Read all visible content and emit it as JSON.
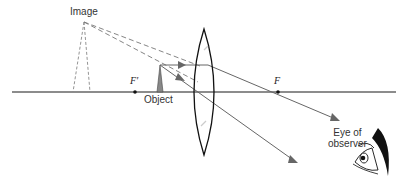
{
  "diagram": {
    "type": "optics-ray-diagram",
    "labels": {
      "image": "Image",
      "object": "Object",
      "focal_left": "F′",
      "focal_right": "F",
      "eye": "Eye of observer",
      "eye_line1": "Eye of",
      "eye_line2": "observer"
    },
    "colors": {
      "axis": "#555555",
      "rays": "#666666",
      "dashed": "#777777",
      "lens": "#111111",
      "object_fill": "#888888",
      "eye": "#111111"
    }
  }
}
